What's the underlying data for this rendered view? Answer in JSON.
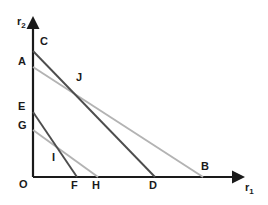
{
  "figure": {
    "type": "line-diagram",
    "background_color": "#ffffff",
    "axes": {
      "x": {
        "label": "r",
        "label_sub": "1",
        "origin_label": "O",
        "color": "#1a1a1a",
        "start_px": [
          33,
          177
        ],
        "end_px": [
          240,
          177
        ],
        "arrow": true
      },
      "y": {
        "label": "r",
        "label_sub": "2",
        "color": "#1a1a1a",
        "start_px": [
          33,
          177
        ],
        "end_px": [
          33,
          22
        ],
        "arrow": true
      }
    },
    "lines": [
      {
        "name": "line-CD",
        "from_label": "C",
        "to_label": "D",
        "color": "#4d4d4d",
        "width": 1.8,
        "from_px": [
          33,
          51
        ],
        "to_px": [
          155,
          177
        ]
      },
      {
        "name": "line-AB",
        "from_label": "A",
        "to_label": "B",
        "color": "#b3b3b3",
        "width": 1.8,
        "from_px": [
          33,
          67
        ],
        "to_px": [
          203,
          177
        ]
      },
      {
        "name": "line-EF",
        "from_label": "E",
        "to_label": "F",
        "color": "#4d4d4d",
        "width": 1.8,
        "from_px": [
          33,
          112
        ],
        "to_px": [
          77,
          177
        ]
      },
      {
        "name": "line-GH",
        "from_label": "G",
        "to_label": "H",
        "color": "#b3b3b3",
        "width": 1.8,
        "from_px": [
          33,
          130
        ],
        "to_px": [
          98,
          177
        ]
      }
    ],
    "point_labels": [
      {
        "name": "label-C",
        "text": "C",
        "x": 40,
        "y": 36
      },
      {
        "name": "label-A",
        "text": "A",
        "x": 18,
        "y": 56
      },
      {
        "name": "label-J",
        "text": "J",
        "x": 76,
        "y": 72
      },
      {
        "name": "label-E",
        "text": "E",
        "x": 18,
        "y": 101
      },
      {
        "name": "label-G",
        "text": "G",
        "x": 18,
        "y": 120
      },
      {
        "name": "label-I",
        "text": "I",
        "x": 52,
        "y": 152
      },
      {
        "name": "label-O",
        "text": "O",
        "x": 19,
        "y": 179
      },
      {
        "name": "label-F",
        "text": "F",
        "x": 71,
        "y": 180
      },
      {
        "name": "label-H",
        "text": "H",
        "x": 92,
        "y": 180
      },
      {
        "name": "label-D",
        "text": "D",
        "x": 149,
        "y": 180
      },
      {
        "name": "label-B",
        "text": "B",
        "x": 201,
        "y": 161
      }
    ],
    "axis_labels": {
      "y_axis": {
        "name": "y-axis-label",
        "x": 17,
        "y": 16
      },
      "x_axis": {
        "name": "x-axis-label",
        "x": 245,
        "y": 182
      }
    },
    "intersections": [
      {
        "name": "intersection-J",
        "of": [
          "line-CD",
          "line-AB"
        ],
        "px": [
          70,
          93
        ]
      },
      {
        "name": "intersection-I",
        "of": [
          "line-EF",
          "line-GH"
        ],
        "px": [
          62,
          160
        ]
      }
    ]
  }
}
